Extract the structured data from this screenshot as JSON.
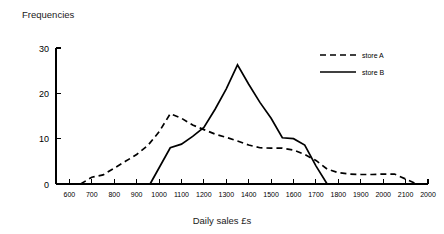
{
  "chart_data": {
    "type": "line",
    "title": "",
    "ylabel": "Frequencies",
    "xlabel": "Daily sales £s",
    "xlim": [
      500,
      2200
    ],
    "ylim": [
      0,
      30
    ],
    "grid": false,
    "legend_position": "top-right",
    "xticks": [
      600,
      700,
      800,
      900,
      1000,
      1100,
      1200,
      1300,
      1400,
      1500,
      1600,
      1700,
      1800,
      1900,
      2000,
      2100,
      2200
    ],
    "xtick_labels": [
      "600",
      "700",
      "800",
      "900",
      "1000",
      "1100",
      "1200",
      "1300",
      "1400",
      "1500",
      "1600",
      "1700",
      "1800",
      "1900",
      "2000",
      "2100",
      "2000"
    ],
    "yticks": [
      0,
      10,
      20,
      30
    ],
    "ytick_labels": [
      "0",
      "10",
      "20",
      "30"
    ],
    "series": [
      {
        "name": "store A",
        "style": "dashed",
        "color": "#000000",
        "x": [
          650,
          700,
          750,
          800,
          850,
          900,
          950,
          1000,
          1050,
          1100,
          1150,
          1200,
          1250,
          1300,
          1350,
          1400,
          1450,
          1500,
          1550,
          1600,
          1650,
          1700,
          1750,
          1800,
          1850,
          1900,
          1950,
          2000,
          2050,
          2150
        ],
        "values": [
          0,
          1.5,
          2,
          3.5,
          5,
          6.5,
          8.5,
          11.5,
          15.5,
          14.5,
          13,
          12,
          11,
          10.3,
          9.5,
          8.6,
          8,
          7.9,
          7.9,
          7.5,
          6.5,
          5.2,
          3.3,
          2.5,
          2.2,
          2.1,
          2.1,
          2.2,
          2.2,
          0
        ]
      },
      {
        "name": "store B",
        "style": "solid",
        "color": "#000000",
        "x": [
          960,
          1050,
          1100,
          1150,
          1200,
          1250,
          1300,
          1350,
          1400,
          1450,
          1500,
          1550,
          1600,
          1650,
          1700,
          1750
        ],
        "values": [
          0,
          8,
          8.8,
          10.5,
          12.5,
          16.5,
          21,
          26.3,
          22,
          18,
          14.5,
          10.2,
          10,
          8.6,
          4,
          0
        ]
      }
    ]
  },
  "legend": {
    "entries": [
      {
        "label": "store A",
        "style": "dashed"
      },
      {
        "label": "store B",
        "style": "solid"
      }
    ]
  }
}
